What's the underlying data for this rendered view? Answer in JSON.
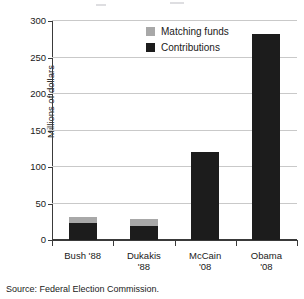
{
  "chart_data": {
    "type": "bar",
    "title": "",
    "subtitle": "",
    "xlabel": "",
    "ylabel": "Millions of dollars",
    "categories": [
      "Bush '88",
      "Dukakis '88",
      "McCain '08",
      "Obama '08"
    ],
    "category_lines": [
      [
        "Bush '88"
      ],
      [
        "Dukakis",
        "'88"
      ],
      [
        "McCain",
        "'08"
      ],
      [
        "Obama",
        "'08"
      ]
    ],
    "stacked": true,
    "series": [
      {
        "name": "Contributions",
        "color": "#1c1c1c",
        "values": [
          23,
          19,
          120,
          282
        ]
      },
      {
        "name": "Matching funds",
        "color": "#a8a8a8",
        "values": [
          8,
          10,
          0,
          0
        ]
      }
    ],
    "totals": [
      31,
      29,
      120,
      282
    ],
    "ylim": [
      0,
      300
    ],
    "yticks": [
      0,
      50,
      100,
      150,
      200,
      250,
      300
    ],
    "ytick_labels": [
      "0",
      "50",
      "100",
      "150",
      "200",
      "250",
      "300"
    ],
    "grid": true,
    "grid_axis": "y",
    "legend_position": "top-right",
    "legend_entries": [
      "Matching funds",
      "Contributions"
    ],
    "source_note": "Source: Federal Election Commission."
  },
  "legend": {
    "matching_label": "Matching funds",
    "contributions_label": "Contributions"
  },
  "axis": {
    "y_title": "Millions of dollars"
  },
  "footer": {
    "source": "Source: Federal Election Commission."
  }
}
